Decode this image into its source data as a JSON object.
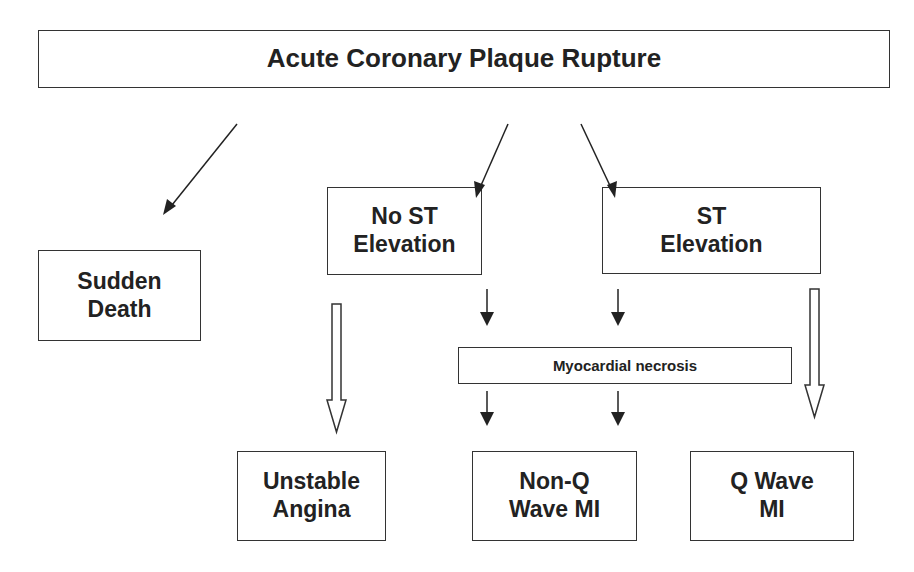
{
  "diagram": {
    "title": "Acute Coronary Plaque Rupture",
    "nodes": {
      "sudden_death": "Sudden\nDeath",
      "no_st_elevation": "No ST\nElevation",
      "st_elevation": "ST\nElevation",
      "myocardial_necrosis": "Myocardial necrosis",
      "unstable_angina": "Unstable\nAngina",
      "non_q_wave_mi": "Non-Q\nWave MI",
      "q_wave_mi": "Q Wave\nMI"
    },
    "edges": [
      {
        "from": "Acute Coronary Plaque Rupture",
        "to": "Sudden Death",
        "style": "solid-arrow"
      },
      {
        "from": "Acute Coronary Plaque Rupture",
        "to": "No ST Elevation",
        "style": "solid-arrow"
      },
      {
        "from": "Acute Coronary Plaque Rupture",
        "to": "ST Elevation",
        "style": "solid-arrow"
      },
      {
        "from": "No ST Elevation",
        "to": "Unstable Angina",
        "style": "hollow-arrow"
      },
      {
        "from": "No ST Elevation",
        "to": "Myocardial necrosis",
        "style": "solid-arrow"
      },
      {
        "from": "ST Elevation",
        "to": "Myocardial necrosis",
        "style": "solid-arrow"
      },
      {
        "from": "ST Elevation",
        "to": "Q Wave MI",
        "style": "hollow-arrow"
      },
      {
        "from": "Myocardial necrosis",
        "to": "Non-Q Wave MI",
        "style": "solid-arrow"
      },
      {
        "from": "Myocardial necrosis",
        "to": "Q Wave MI",
        "style": "solid-arrow"
      }
    ]
  }
}
